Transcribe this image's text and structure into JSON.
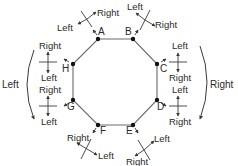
{
  "diagram": {
    "type": "octagon-direction-diagram",
    "colors": {
      "stroke": "#3a3a3a",
      "octagon_stroke": "#6a6a6a",
      "text": "#2a2a2a",
      "background": "#ffffff"
    },
    "vertices": [
      {
        "id": "A",
        "label": "A",
        "x": 98,
        "y": 39
      },
      {
        "id": "B",
        "label": "B",
        "x": 133,
        "y": 39
      },
      {
        "id": "C",
        "label": "C",
        "x": 157,
        "y": 64
      },
      {
        "id": "D",
        "label": "D",
        "x": 157,
        "y": 100
      },
      {
        "id": "E",
        "label": "E",
        "x": 133,
        "y": 125
      },
      {
        "id": "F",
        "label": "F",
        "x": 98,
        "y": 125
      },
      {
        "id": "G",
        "label": "G",
        "x": 73,
        "y": 100
      },
      {
        "id": "H",
        "label": "H",
        "x": 73,
        "y": 64
      }
    ],
    "crosshairs": {
      "A": {
        "first": "Right",
        "second": "Left"
      },
      "B": {
        "first": "Left",
        "second": "Right"
      },
      "C": {
        "first": "Left",
        "second": "Right"
      },
      "D": {
        "first": "Left",
        "second": "Right"
      },
      "E": {
        "first": "Left",
        "second": "Right"
      },
      "F": {
        "first": "Right",
        "second": "Left"
      },
      "G": {
        "first": "Right",
        "second": "Left"
      },
      "H": {
        "first": "Right",
        "second": "Left"
      }
    },
    "side_labels": {
      "left": "Left",
      "right": "Right"
    }
  }
}
